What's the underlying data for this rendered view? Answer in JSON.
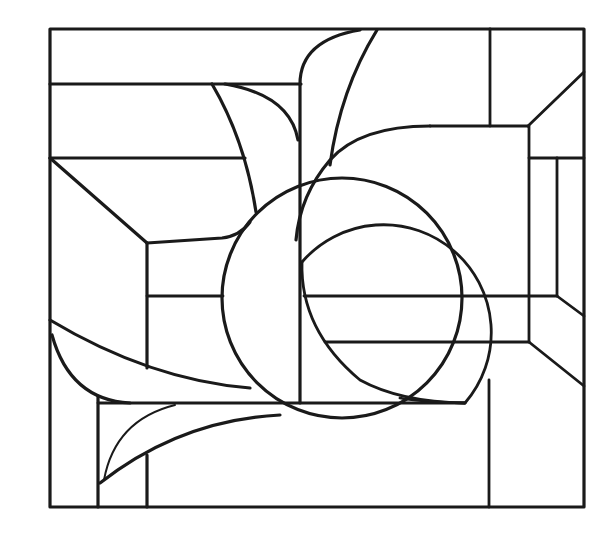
{
  "artwork": {
    "title": "Stained glass line-art pattern",
    "style": "black line drawing on white",
    "colors": {
      "line": "#1a1a1a",
      "background": "#ffffff"
    },
    "elements": [
      "outer-frame",
      "horizontal-leads",
      "vertical-leads",
      "diagonal-corner-leads",
      "large-circle",
      "overlapping-circle",
      "leaf-petal-shapes",
      "sweeping-curves"
    ]
  }
}
